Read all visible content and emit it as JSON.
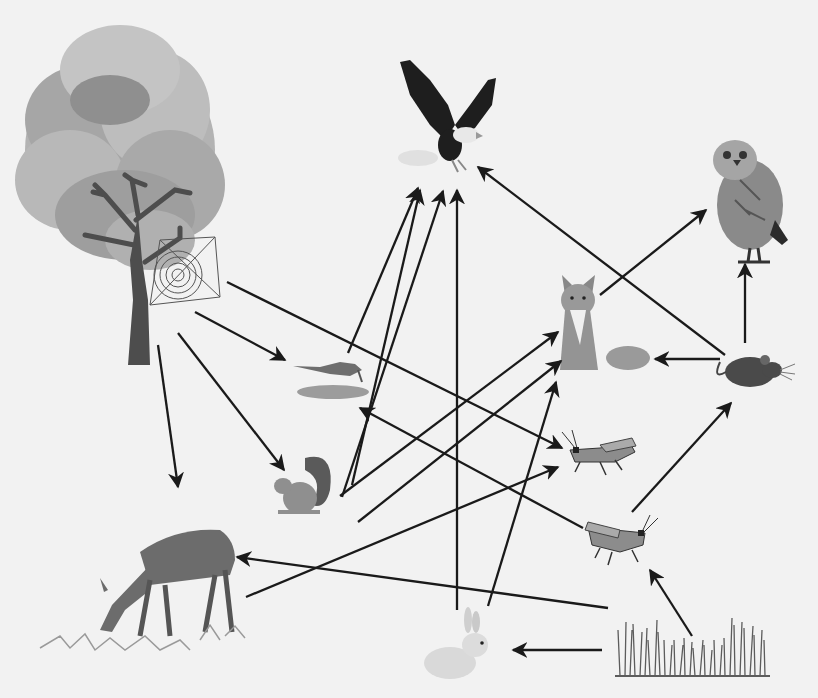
{
  "diagram": {
    "type": "food-web",
    "background": "#f2f2f2",
    "arrow_color": "#1a1a1a",
    "organisms": [
      {
        "id": "tree",
        "label": "Tree",
        "icon": "tree-icon",
        "x": 120,
        "y": 195
      },
      {
        "id": "spider",
        "label": "Spider web",
        "icon": "spider-web-icon",
        "x": 185,
        "y": 268
      },
      {
        "id": "eagle",
        "label": "Eagle",
        "icon": "eagle-icon",
        "x": 445,
        "y": 115
      },
      {
        "id": "owl",
        "label": "Owl",
        "icon": "owl-icon",
        "x": 750,
        "y": 195
      },
      {
        "id": "fox",
        "label": "Fox",
        "icon": "fox-icon",
        "x": 600,
        "y": 325
      },
      {
        "id": "mouse",
        "label": "Mouse",
        "icon": "mouse-icon",
        "x": 748,
        "y": 372
      },
      {
        "id": "bird",
        "label": "Bird",
        "icon": "bird-icon",
        "x": 335,
        "y": 378
      },
      {
        "id": "squirrel",
        "label": "Squirrel",
        "icon": "squirrel-icon",
        "x": 305,
        "y": 490
      },
      {
        "id": "grasshopper1",
        "label": "Grasshopper",
        "icon": "grasshopper-icon",
        "x": 600,
        "y": 455
      },
      {
        "id": "grasshopper2",
        "label": "Grasshopper",
        "icon": "grasshopper-icon",
        "x": 612,
        "y": 540
      },
      {
        "id": "deer",
        "label": "Deer",
        "icon": "deer-icon",
        "x": 165,
        "y": 580
      },
      {
        "id": "rabbit",
        "label": "Rabbit",
        "icon": "rabbit-icon",
        "x": 460,
        "y": 655
      },
      {
        "id": "grass",
        "label": "Grass",
        "icon": "grass-icon",
        "x": 690,
        "y": 655
      }
    ],
    "arrows": [
      {
        "from": "tree",
        "to": "bird",
        "x1": 195,
        "y1": 312,
        "x2": 285,
        "y2": 360
      },
      {
        "from": "tree",
        "to": "grasshopper1",
        "x1": 227,
        "y1": 282,
        "x2": 562,
        "y2": 448
      },
      {
        "from": "tree",
        "to": "squirrel",
        "x1": 178,
        "y1": 333,
        "x2": 284,
        "y2": 470
      },
      {
        "from": "tree",
        "to": "deer",
        "x1": 158,
        "y1": 345,
        "x2": 178,
        "y2": 487
      },
      {
        "from": "bird",
        "to": "eagle",
        "x1": 348,
        "y1": 353,
        "x2": 418,
        "y2": 188
      },
      {
        "from": "squirrel",
        "to": "eagle",
        "x1": 342,
        "y1": 497,
        "x2": 443,
        "y2": 191
      },
      {
        "from": "squirrel",
        "to": "eagle",
        "x1": 352,
        "y1": 485,
        "x2": 420,
        "y2": 190
      },
      {
        "from": "rabbit",
        "to": "eagle",
        "x1": 457,
        "y1": 610,
        "x2": 457,
        "y2": 190
      },
      {
        "from": "mouse",
        "to": "eagle",
        "x1": 725,
        "y1": 355,
        "x2": 478,
        "y2": 167
      },
      {
        "from": "fox",
        "to": "owl",
        "x1": 600,
        "y1": 295,
        "x2": 706,
        "y2": 210
      },
      {
        "from": "mouse",
        "to": "owl",
        "x1": 745,
        "y1": 343,
        "x2": 745,
        "y2": 264
      },
      {
        "from": "mouse",
        "to": "fox",
        "x1": 720,
        "y1": 359,
        "x2": 655,
        "y2": 359
      },
      {
        "from": "squirrel",
        "to": "fox",
        "x1": 340,
        "y1": 496,
        "x2": 558,
        "y2": 332
      },
      {
        "from": "squirrel",
        "to": "fox",
        "x1": 358,
        "y1": 522,
        "x2": 561,
        "y2": 361
      },
      {
        "from": "rabbit",
        "to": "fox",
        "x1": 488,
        "y1": 606,
        "x2": 556,
        "y2": 382
      },
      {
        "from": "deer",
        "to": "grasshopper1",
        "x1": 246,
        "y1": 597,
        "x2": 558,
        "y2": 467
      },
      {
        "from": "grasshopper2",
        "to": "bird",
        "x1": 583,
        "y1": 528,
        "x2": 360,
        "y2": 408
      },
      {
        "from": "grasshopper2",
        "to": "mouse",
        "x1": 632,
        "y1": 512,
        "x2": 731,
        "y2": 403
      },
      {
        "from": "grass",
        "to": "deer",
        "x1": 608,
        "y1": 608,
        "x2": 237,
        "y2": 557
      },
      {
        "from": "grass",
        "to": "rabbit",
        "x1": 602,
        "y1": 650,
        "x2": 513,
        "y2": 650
      },
      {
        "from": "grass",
        "to": "grasshopper2",
        "x1": 692,
        "y1": 636,
        "x2": 650,
        "y2": 570
      }
    ]
  }
}
